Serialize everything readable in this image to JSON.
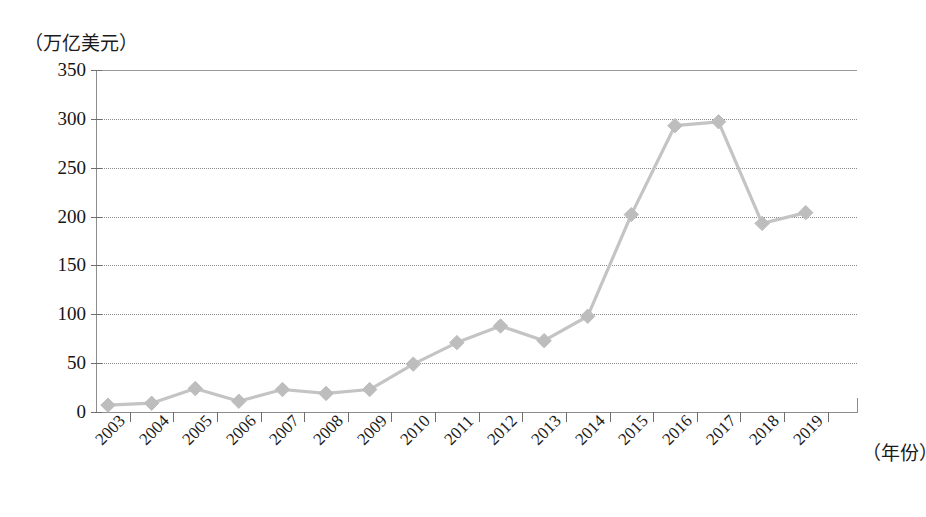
{
  "chart_data": {
    "type": "line",
    "title": "",
    "subtitle": "",
    "xlabel": "（年份）",
    "ylabel": "（万亿美元）",
    "categories": [
      "2003",
      "2004",
      "2005",
      "2006",
      "2007",
      "2008",
      "2009",
      "2010",
      "2011",
      "2012",
      "2013",
      "2014",
      "2015",
      "2016",
      "2017",
      "2018",
      "2019"
    ],
    "values": [
      7,
      9,
      24,
      11,
      23,
      19,
      23,
      49,
      71,
      88,
      73,
      98,
      202,
      293,
      297,
      193,
      204
    ],
    "series": [
      {
        "name": "",
        "values": [
          7,
          9,
          24,
          11,
          23,
          19,
          23,
          49,
          71,
          88,
          73,
          98,
          202,
          293,
          297,
          193,
          204
        ]
      }
    ],
    "ylim": [
      0,
      350
    ],
    "ytick_labels": [
      "0",
      "50",
      "100",
      "150",
      "200",
      "250",
      "300",
      "350"
    ],
    "ytick_values": [
      0,
      50,
      100,
      150,
      200,
      250,
      300,
      350
    ],
    "grid": true,
    "legend": false,
    "legend_position": "none",
    "annotations": [],
    "marker": "diamond",
    "line_color": "#c4c4c4",
    "marker_color": "#bdbdbd",
    "grid_color": "#8a8a8a",
    "axis_color": "#8d8d8d"
  },
  "axes": {
    "y_unit_caption": "（万亿美元）",
    "x_unit_caption": "（年份）"
  }
}
